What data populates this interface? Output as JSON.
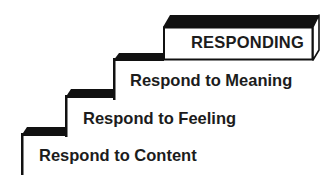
{
  "diagram": {
    "type": "staircase",
    "colors": {
      "ink": "#111111",
      "text": "#1c1c1c",
      "background": "#ffffff"
    },
    "top_box": {
      "label": "RESPONDING"
    },
    "steps": [
      {
        "level": 1,
        "label": "Respond to Content"
      },
      {
        "level": 2,
        "label": "Respond to Feeling"
      },
      {
        "level": 3,
        "label": "Respond to Meaning"
      }
    ]
  }
}
